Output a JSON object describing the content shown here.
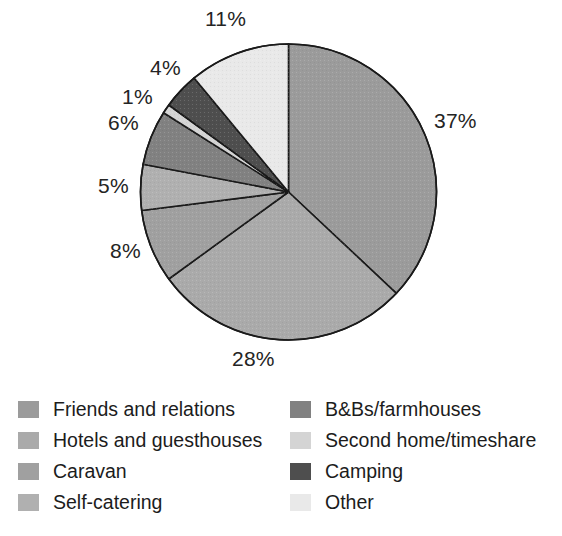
{
  "chart_data": {
    "type": "pie",
    "title": "",
    "subtitle": "",
    "xlabel": "",
    "ylabel": "",
    "legend_position": "bottom",
    "grid": false,
    "start_angle_deg": 0,
    "direction": "clockwise",
    "categories": [
      "Friends and relations",
      "Hotels and guesthouses",
      "Caravan",
      "Self-catering",
      "B&Bs/farmhouses",
      "Second home/timeshare",
      "Camping",
      "Other"
    ],
    "values": [
      37,
      28,
      8,
      5,
      6,
      1,
      4,
      11
    ],
    "value_unit": "%",
    "data_labels": [
      "37%",
      "28%",
      "8%",
      "5%",
      "6%",
      "1%",
      "4%",
      "11%"
    ],
    "colors": [
      "#9b9b9b",
      "#aaaaaa",
      "#a0a0a0",
      "#b0b0b0",
      "#818181",
      "#d4d4d4",
      "#4e4e4e",
      "#e9e9e9"
    ],
    "slice_border_color": "#1a1a1a",
    "slices": [
      {
        "label": "Friends and relations",
        "value": 37,
        "display": "37%",
        "color": "#9b9b9b"
      },
      {
        "label": "Hotels and guesthouses",
        "value": 28,
        "display": "28%",
        "color": "#aaaaaa"
      },
      {
        "label": "Caravan",
        "value": 8,
        "display": "8%",
        "color": "#a0a0a0"
      },
      {
        "label": "Self-catering",
        "value": 5,
        "display": "5%",
        "color": "#b0b0b0"
      },
      {
        "label": "B&Bs/farmhouses",
        "value": 6,
        "display": "6%",
        "color": "#818181"
      },
      {
        "label": "Second home/timeshare",
        "value": 1,
        "display": "1%",
        "color": "#d4d4d4"
      },
      {
        "label": "Camping",
        "value": 4,
        "display": "4%",
        "color": "#4e4e4e"
      },
      {
        "label": "Other",
        "value": 11,
        "display": "11%",
        "color": "#e9e9e9"
      }
    ]
  },
  "pie_labels": [
    {
      "text": "11%",
      "x": 205,
      "y": 8
    },
    {
      "text": "4%",
      "x": 150,
      "y": 57
    },
    {
      "text": "1%",
      "x": 122,
      "y": 86
    },
    {
      "text": "6%",
      "x": 108,
      "y": 112
    },
    {
      "text": "5%",
      "x": 98,
      "y": 175
    },
    {
      "text": "8%",
      "x": 110,
      "y": 240
    },
    {
      "text": "37%",
      "x": 434,
      "y": 110
    },
    {
      "text": "28%",
      "x": 232,
      "y": 348
    }
  ],
  "legend": {
    "columns": [
      {
        "items": [
          {
            "label": "Friends and relations",
            "color": "#9b9b9b"
          },
          {
            "label": "Hotels and guesthouses",
            "color": "#aaaaaa"
          },
          {
            "label": "Caravan",
            "color": "#a0a0a0"
          },
          {
            "label": "Self-catering",
            "color": "#b0b0b0"
          }
        ]
      },
      {
        "items": [
          {
            "label": "B&Bs/farmhouses",
            "color": "#818181"
          },
          {
            "label": "Second home/timeshare",
            "color": "#d4d4d4"
          },
          {
            "label": "Camping",
            "color": "#4e4e4e"
          },
          {
            "label": "Other",
            "color": "#e9e9e9"
          }
        ]
      }
    ]
  }
}
